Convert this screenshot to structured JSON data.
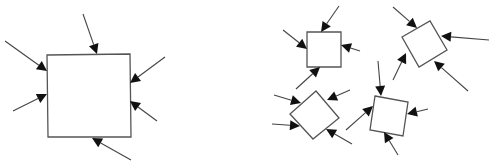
{
  "caption": "",
  "colors": {
    "box_stroke": "#555555",
    "arrow_line": "#444444",
    "arrow_head": "#111111"
  },
  "panels": [
    {
      "name": "single-large-system",
      "shapes": [
        {
          "id": "A",
          "points": [
            [
              47,
              55
            ],
            [
              130,
              54
            ],
            [
              131,
              137
            ],
            [
              48,
              137
            ]
          ]
        }
      ],
      "arrows": [
        [
          83,
          14,
          97,
          54
        ],
        [
          5,
          41,
          47,
          71
        ],
        [
          13,
          111,
          47,
          94
        ],
        [
          165,
          57,
          130,
          83
        ],
        [
          157,
          121,
          130,
          101
        ],
        [
          131,
          160,
          92,
          138
        ]
      ]
    },
    {
      "name": "multiple-small-systems",
      "shapes": [
        {
          "id": "B",
          "points": [
            [
              307,
              32
            ],
            [
              341,
              32
            ],
            [
              341,
              67
            ],
            [
              307,
              67
            ]
          ]
        },
        {
          "id": "C",
          "points": [
            [
              316,
              91
            ],
            [
              339,
              118
            ],
            [
              313,
              139
            ],
            [
              290,
              114
            ]
          ]
        },
        {
          "id": "D",
          "points": [
            [
              375,
              96
            ],
            [
              408,
              102
            ],
            [
              403,
              136
            ],
            [
              370,
              130
            ]
          ]
        },
        {
          "id": "E",
          "points": [
            [
              402,
              37
            ],
            [
              430,
              21
            ],
            [
              447,
              50
            ],
            [
              419,
              67
            ]
          ]
        }
      ],
      "arrows": [
        [
          339,
          6,
          321,
          32
        ],
        [
          283,
          30,
          307,
          49
        ],
        [
          360,
          51,
          341,
          45
        ],
        [
          296,
          89,
          320,
          67
        ],
        [
          274,
          95,
          301,
          103
        ],
        [
          350,
          90,
          327,
          100
        ],
        [
          272,
          124,
          300,
          126
        ],
        [
          352,
          144,
          326,
          129
        ],
        [
          378,
          61,
          381,
          96
        ],
        [
          346,
          130,
          373,
          106
        ],
        [
          428,
          109,
          407,
          114
        ],
        [
          398,
          155,
          384,
          132
        ],
        [
          393,
          7,
          417,
          28
        ],
        [
          489,
          40,
          441,
          36
        ],
        [
          393,
          80,
          406,
          53
        ],
        [
          468,
          91,
          434,
          61
        ]
      ]
    }
  ]
}
